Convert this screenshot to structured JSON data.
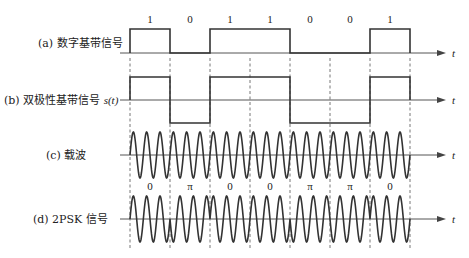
{
  "diagram": {
    "bits": [
      "1",
      "0",
      "1",
      "1",
      "0",
      "0",
      "1"
    ],
    "phases": [
      "0",
      "π",
      "0",
      "0",
      "π",
      "π",
      "0"
    ],
    "axis_label": "t",
    "cycles_per_bit": 3,
    "rows": [
      {
        "id": "a",
        "label": "(a) 数字基带信号",
        "type": "unipolar"
      },
      {
        "id": "b",
        "label": "(b) 双极性基带信号 ",
        "label_italic": "s(t)",
        "type": "bipolar"
      },
      {
        "id": "c",
        "label": "(c) 载波",
        "type": "carrier"
      },
      {
        "id": "d",
        "label": "(d) 2PSK 信号",
        "type": "psk"
      }
    ],
    "colors": {
      "signal": "#333333",
      "axis": "#555555",
      "dash": "#666666",
      "text": "#222222"
    }
  }
}
